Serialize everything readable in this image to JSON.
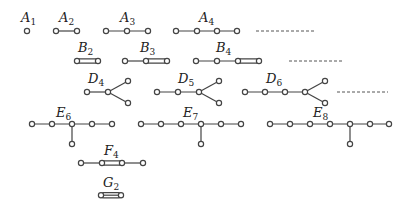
{
  "figure": {
    "diagrams": [
      {
        "id": "A1",
        "letter": "A",
        "sub": "1"
      },
      {
        "id": "A2",
        "letter": "A",
        "sub": "2"
      },
      {
        "id": "A3",
        "letter": "A",
        "sub": "3"
      },
      {
        "id": "A4",
        "letter": "A",
        "sub": "4"
      },
      {
        "id": "B2",
        "letter": "B",
        "sub": "2"
      },
      {
        "id": "B3",
        "letter": "B",
        "sub": "3"
      },
      {
        "id": "B4",
        "letter": "B",
        "sub": "4"
      },
      {
        "id": "D4",
        "letter": "D",
        "sub": "4"
      },
      {
        "id": "D5",
        "letter": "D",
        "sub": "5"
      },
      {
        "id": "D6",
        "letter": "D",
        "sub": "6"
      },
      {
        "id": "E6",
        "letter": "E",
        "sub": "6"
      },
      {
        "id": "E7",
        "letter": "E",
        "sub": "7"
      },
      {
        "id": "E8",
        "letter": "E",
        "sub": "8"
      },
      {
        "id": "F4",
        "letter": "F",
        "sub": "4"
      },
      {
        "id": "G2",
        "letter": "G",
        "sub": "2"
      }
    ],
    "continuation_marks": [
      "A-series continues",
      "B-series continues",
      "D-series continues"
    ]
  }
}
